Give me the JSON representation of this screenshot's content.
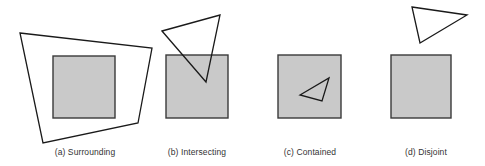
{
  "figure": {
    "panels": [
      {
        "id": "a",
        "caption": "(a) Surrounding",
        "caption_center_x": 85,
        "square": {
          "x": 53,
          "y": 56,
          "w": 62,
          "h": 62
        },
        "polygon": {
          "type": "quadrilateral",
          "points": "20,33 152,48 138,123 43,143"
        }
      },
      {
        "id": "b",
        "caption": "(b) Intersecting",
        "caption_center_x": 197,
        "square": {
          "x": 166,
          "y": 55,
          "w": 62,
          "h": 63
        },
        "polygon": {
          "type": "triangle",
          "points": "162,31 220,15 206,82"
        }
      },
      {
        "id": "c",
        "caption": "(c) Contained",
        "caption_center_x": 310,
        "square": {
          "x": 278,
          "y": 55,
          "w": 63,
          "h": 63
        },
        "polygon": {
          "type": "triangle",
          "points": "300,95 329,78 322,101"
        }
      },
      {
        "id": "d",
        "caption": "(d) Disjoint",
        "caption_center_x": 426,
        "square": {
          "x": 391,
          "y": 55,
          "w": 60,
          "h": 63
        },
        "polygon": {
          "type": "triangle",
          "points": "412,7 467,15 420,43"
        }
      }
    ],
    "colors": {
      "square_fill": "#c9c9c9",
      "square_stroke": "#3a3a3a",
      "polygon_stroke": "#1a1a1a",
      "background": "#ffffff"
    }
  }
}
